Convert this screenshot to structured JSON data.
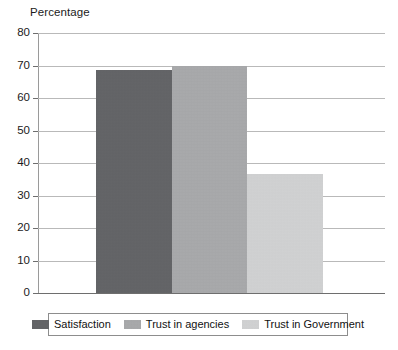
{
  "chart_data": {
    "type": "bar",
    "title": "Percentage",
    "xlabel": "",
    "ylabel": "Percentage",
    "ylim": [
      0,
      80
    ],
    "ytick_step": 10,
    "yticks": [
      "80",
      "70",
      "60",
      "50",
      "40",
      "30",
      "20",
      "10",
      "0"
    ],
    "grid": true,
    "legend_position": "bottom",
    "categories": [
      "Satisfaction",
      "Trust in agencies",
      "Trust in Government"
    ],
    "values": [
      68.5,
      70,
      36.5
    ],
    "series": [
      {
        "name": "Satisfaction",
        "value": 68.5,
        "color": "#5f6063"
      },
      {
        "name": "Trust in agencies",
        "value": 70,
        "color": "#a8a9ab"
      },
      {
        "name": "Trust in Government",
        "value": 36.5,
        "color": "#d3d4d5"
      }
    ]
  },
  "legend": {
    "items": [
      {
        "label": "Satisfaction",
        "color": "#5f6063"
      },
      {
        "label": "Trust in agencies",
        "color": "#a8a9ab"
      },
      {
        "label": "Trust in Government",
        "color": "#d3d4d5"
      }
    ]
  },
  "colors": {
    "gridline": "#b9b9b9",
    "axis": "#6e6e6e",
    "background": "#ffffff",
    "text": "#1b1b1b"
  }
}
